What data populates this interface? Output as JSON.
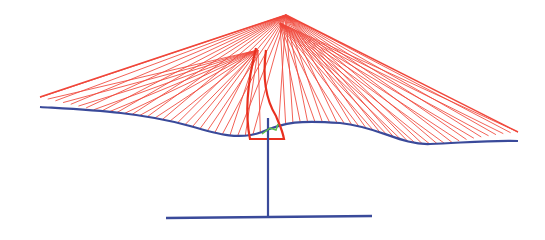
{
  "diagram": {
    "type": "wireframe-3d",
    "colors": {
      "fan_lines": "#f0463a",
      "edge_curve": "#3a4a9a",
      "mast": "#3a4a9a",
      "base": "#3a4a9a",
      "loop": "#e8301f",
      "marker": "#5cc04a",
      "background": "#ffffff"
    },
    "apex": {
      "x": 286,
      "y": 15
    },
    "apex_secondary": {
      "x": 258,
      "y": 50
    },
    "fan_line_count_left": 30,
    "fan_line_count_right": 34,
    "edge_curve_path": "M40,107 C90,110 140,112 190,126 C220,135 240,140 262,132 C285,122 300,120 340,123 C380,127 400,145 430,144 C460,143 490,140 518,141",
    "left_upper_edge": {
      "x1": 40,
      "y1": 97,
      "x2": 286,
      "y2": 15
    },
    "right_upper_edge": {
      "x1": 286,
      "y1": 15,
      "x2": 518,
      "y2": 132
    },
    "mast": {
      "x": 268,
      "y_top": 118,
      "y_bottom": 217
    },
    "base_line": {
      "x1": 166,
      "y1": 218,
      "x2": 372,
      "y2": 216
    },
    "loop_path": "M256,48 C248,80 244,110 250,139 L284,139 C282,128 278,122 276,116 C266,100 262,80 266,50",
    "marker_path": "M262,134 L270,128 L276,130 L278,124"
  }
}
